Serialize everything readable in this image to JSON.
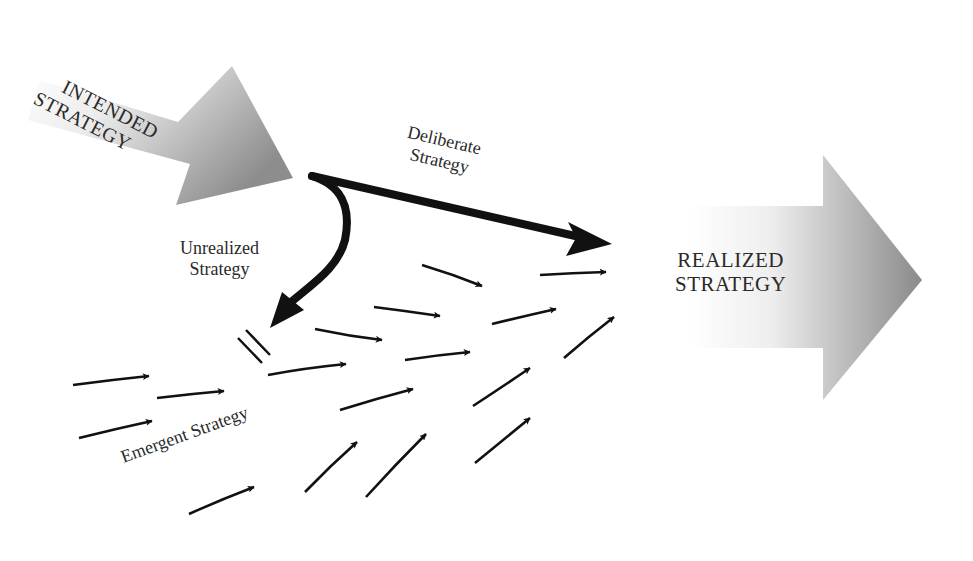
{
  "diagram": {
    "labels": {
      "intended": [
        "INTENDED",
        "STRATEGY"
      ],
      "deliberate": [
        "Deliberate",
        "Strategy"
      ],
      "unrealized": [
        "Unrealized",
        "Strategy"
      ],
      "emergent": "Emergent Strategy",
      "realized": [
        "REALIZED",
        "STRATEGY"
      ]
    },
    "colors": {
      "arrow_ink": "#111111",
      "gradient_light": "#ffffff",
      "gradient_dark": "#8a8a8a",
      "text": "#2a2a2a"
    },
    "nodes": [
      {
        "id": "intended",
        "shape": "gradient-arrow",
        "direction": "down-right"
      },
      {
        "id": "realized",
        "shape": "gradient-arrow",
        "direction": "right"
      }
    ],
    "edges": [
      {
        "from": "intended",
        "to": "realized",
        "label": "Deliberate Strategy",
        "style": "thick"
      },
      {
        "from": "intended",
        "to": "blocked",
        "label": "Unrealized Strategy",
        "style": "thick-curved",
        "terminator": "double-bar"
      },
      {
        "from": "emergent",
        "to": "realized",
        "label": "Emergent Strategy",
        "style": "many-thin-arrows",
        "count": 19
      }
    ]
  }
}
